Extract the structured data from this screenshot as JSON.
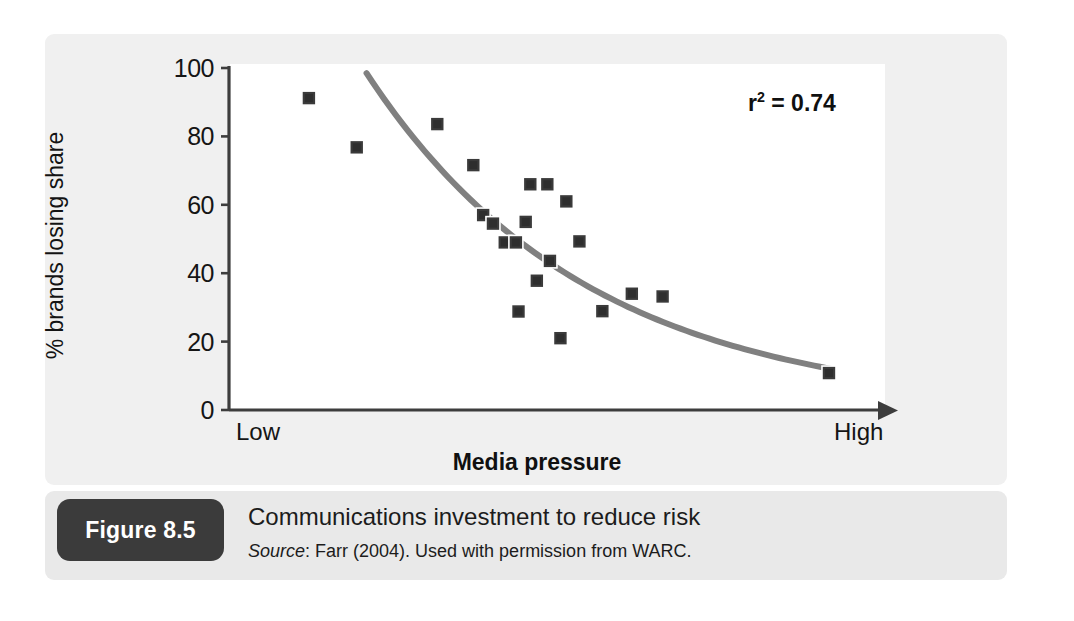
{
  "figure": {
    "badge_label": "Figure 8.5",
    "title": "Communications investment to reduce risk",
    "source_word": "Source",
    "source_rest": ": Farr (2004). Used with permission from WARC."
  },
  "chart_data": {
    "type": "scatter",
    "title": "",
    "xlabel": "Media pressure",
    "ylabel": "% brands losing share",
    "x_tick_labels": [
      "Low",
      "High"
    ],
    "y_ticks": [
      0,
      20,
      40,
      60,
      80,
      100
    ],
    "ylim": [
      0,
      100
    ],
    "xlim": [
      0,
      100
    ],
    "grid": false,
    "legend": "none",
    "annotation": "r2 = 0.74",
    "annotation_label": "r",
    "annotation_sup": "2",
    "annotation_value": "= 0.74",
    "r_squared": 0.74,
    "marker": "square",
    "marker_color": "#3a3a3a",
    "trend_color": "#808080",
    "points": [
      {
        "x": 12.2,
        "y": 91.2
      },
      {
        "x": 19.5,
        "y": 76.8
      },
      {
        "x": 31.8,
        "y": 83.6
      },
      {
        "x": 37.3,
        "y": 71.6
      },
      {
        "x": 46.0,
        "y": 66.0
      },
      {
        "x": 48.6,
        "y": 66.0
      },
      {
        "x": 51.5,
        "y": 61.0
      },
      {
        "x": 38.8,
        "y": 57.0
      },
      {
        "x": 40.3,
        "y": 54.5
      },
      {
        "x": 45.3,
        "y": 55.0
      },
      {
        "x": 42.1,
        "y": 49.0
      },
      {
        "x": 43.8,
        "y": 49.0
      },
      {
        "x": 53.5,
        "y": 49.3
      },
      {
        "x": 49.0,
        "y": 43.6
      },
      {
        "x": 47.0,
        "y": 37.8
      },
      {
        "x": 44.2,
        "y": 28.8
      },
      {
        "x": 50.6,
        "y": 21.0
      },
      {
        "x": 57.0,
        "y": 28.9
      },
      {
        "x": 61.5,
        "y": 34.0
      },
      {
        "x": 66.2,
        "y": 33.2
      },
      {
        "x": 91.6,
        "y": 10.8
      }
    ],
    "trend_line": {
      "type": "exponential-decay",
      "x_start": 21.0,
      "y_start": 98.5,
      "x_end": 92.0,
      "y_end": 12.0
    },
    "colors": {
      "panel": "#f0f0f0",
      "plot_background": "#ffffff",
      "caption_band": "#e9e9e9",
      "badge": "#3b3b3b",
      "axis": "#3d3d3d",
      "text": "#151515"
    }
  }
}
